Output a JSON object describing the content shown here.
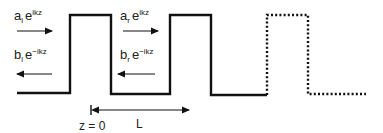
{
  "diagram": {
    "colors": {
      "line": "#111111",
      "text": "#222222",
      "background": "#ffffff"
    },
    "labels": {
      "left_incoming": {
        "coef": "a",
        "sub": "l",
        "base": "e",
        "exp": "ikz"
      },
      "left_reflected": {
        "coef": "b",
        "sub": "l",
        "base": "e",
        "exp": "−ikz"
      },
      "right_incoming": {
        "coef": "a",
        "sub": "r",
        "base": "e",
        "exp": "ikz"
      },
      "right_reflected": {
        "coef": "b",
        "sub": "r",
        "base": "e",
        "exp": "−ikz"
      },
      "origin": "z = 0",
      "period": "L"
    },
    "barriers": [
      {
        "name": "barrier-1",
        "style": "solid"
      },
      {
        "name": "barrier-2",
        "style": "solid"
      },
      {
        "name": "barrier-3",
        "style": "dotted"
      }
    ]
  }
}
